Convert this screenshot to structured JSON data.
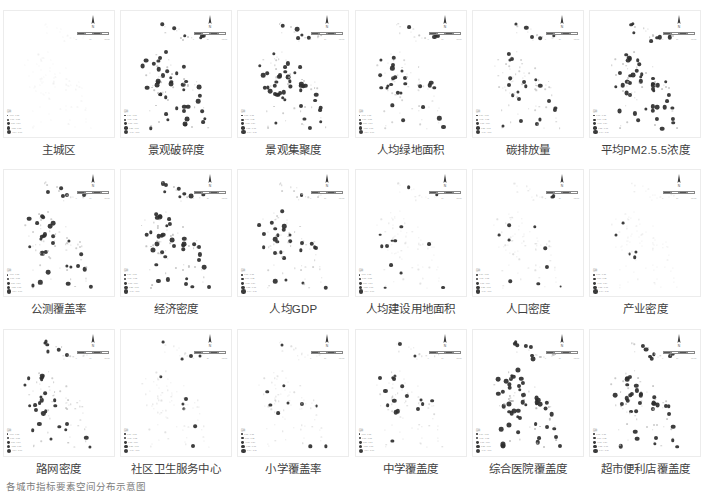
{
  "figure": {
    "caption": "各城市指标要素空间分布示意图",
    "background_color": "#ffffff",
    "point_color": "#2e2e2e",
    "panel_border_color": "#ececec"
  },
  "map_elements": {
    "north_arrow_name": "N",
    "scalebar_ticks": [
      "0",
      "25",
      "50",
      "100 km"
    ],
    "legend_title": "图例",
    "legend_classes": [
      {
        "label": "0.00 - 0.18",
        "size": 1.6
      },
      {
        "label": "0.19 - 0.35",
        "size": 2.2
      },
      {
        "label": "0.36 - 0.54",
        "size": 2.9
      },
      {
        "label": "0.55 - 0.73",
        "size": 3.6
      },
      {
        "label": "0.74 - 1.00",
        "size": 4.4
      }
    ]
  },
  "chart_data": {
    "type": "scatter",
    "title": "各城市指标要素空间分布示意图",
    "xlabel": "",
    "ylabel": "",
    "grid": false,
    "legend_position": "bottom-left",
    "panel_count": 18,
    "rows": 3,
    "cols": 6,
    "symbol": "graduated-circle",
    "shared_x": "longitude (normalized 0-1)",
    "shared_y": "latitude (normalized 0-1)",
    "panels": [
      {
        "index": 0,
        "label": "主城区",
        "row": 1,
        "col": 1,
        "intensity": 0.1,
        "dark_fraction": 0.0,
        "mean_value": 0.08,
        "n_points": 96
      },
      {
        "index": 1,
        "label": "景观破碎度",
        "row": 1,
        "col": 2,
        "intensity": 0.72,
        "dark_fraction": 0.46,
        "mean_value": 0.55,
        "n_points": 96
      },
      {
        "index": 2,
        "label": "景观集聚度",
        "row": 1,
        "col": 3,
        "intensity": 0.66,
        "dark_fraction": 0.4,
        "mean_value": 0.5,
        "n_points": 96
      },
      {
        "index": 3,
        "label": "人均绿地面积",
        "row": 1,
        "col": 4,
        "intensity": 0.55,
        "dark_fraction": 0.3,
        "mean_value": 0.41,
        "n_points": 96
      },
      {
        "index": 4,
        "label": "碳排放量",
        "row": 1,
        "col": 5,
        "intensity": 0.6,
        "dark_fraction": 0.34,
        "mean_value": 0.45,
        "n_points": 96
      },
      {
        "index": 5,
        "label": "平均PM2.5.5浓度",
        "row": 1,
        "col": 6,
        "intensity": 0.7,
        "dark_fraction": 0.44,
        "mean_value": 0.53,
        "n_points": 96
      },
      {
        "index": 6,
        "label": "公测覆盖率",
        "row": 2,
        "col": 1,
        "intensity": 0.64,
        "dark_fraction": 0.38,
        "mean_value": 0.48,
        "n_points": 96
      },
      {
        "index": 7,
        "label": "经济密度",
        "row": 2,
        "col": 2,
        "intensity": 0.74,
        "dark_fraction": 0.48,
        "mean_value": 0.57,
        "n_points": 96
      },
      {
        "index": 8,
        "label": "人均GDP",
        "row": 2,
        "col": 3,
        "intensity": 0.58,
        "dark_fraction": 0.32,
        "mean_value": 0.43,
        "n_points": 96
      },
      {
        "index": 9,
        "label": "人均建设用地面积",
        "row": 2,
        "col": 4,
        "intensity": 0.3,
        "dark_fraction": 0.1,
        "mean_value": 0.22,
        "n_points": 96
      },
      {
        "index": 10,
        "label": "人口密度",
        "row": 2,
        "col": 5,
        "intensity": 0.36,
        "dark_fraction": 0.14,
        "mean_value": 0.27,
        "n_points": 96
      },
      {
        "index": 11,
        "label": "产业密度",
        "row": 2,
        "col": 6,
        "intensity": 0.26,
        "dark_fraction": 0.08,
        "mean_value": 0.19,
        "n_points": 96
      },
      {
        "index": 12,
        "label": "路网密度",
        "row": 3,
        "col": 1,
        "intensity": 0.62,
        "dark_fraction": 0.36,
        "mean_value": 0.46,
        "n_points": 96
      },
      {
        "index": 13,
        "label": "社区卫生服务中心",
        "row": 3,
        "col": 2,
        "intensity": 0.34,
        "dark_fraction": 0.12,
        "mean_value": 0.25,
        "n_points": 96
      },
      {
        "index": 14,
        "label": "小学覆盖率",
        "row": 3,
        "col": 3,
        "intensity": 0.4,
        "dark_fraction": 0.18,
        "mean_value": 0.3,
        "n_points": 96
      },
      {
        "index": 15,
        "label": "中学覆盖度",
        "row": 3,
        "col": 4,
        "intensity": 0.5,
        "dark_fraction": 0.26,
        "mean_value": 0.37,
        "n_points": 96
      },
      {
        "index": 16,
        "label": "综合医院覆盖度",
        "row": 3,
        "col": 5,
        "intensity": 0.8,
        "dark_fraction": 0.56,
        "mean_value": 0.63,
        "n_points": 96
      },
      {
        "index": 17,
        "label": "超市便利店覆盖度",
        "row": 3,
        "col": 6,
        "intensity": 0.68,
        "dark_fraction": 0.42,
        "mean_value": 0.51,
        "n_points": 96
      }
    ]
  }
}
